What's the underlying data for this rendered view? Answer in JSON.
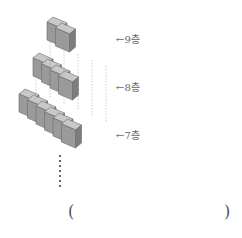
{
  "diagram": {
    "layers": [
      {
        "floor_label": "9층",
        "cube_count": 2
      },
      {
        "floor_label": "8층",
        "cube_count": 4
      },
      {
        "floor_label": "7층",
        "cube_count": 6
      }
    ],
    "arrow_glyph": "←",
    "continuation": "⋮",
    "answer": {
      "open": "(",
      "close": ")",
      "value": ""
    }
  },
  "colors": {
    "cube_front": "#9a9a9a",
    "cube_side": "#7d7d7d",
    "cube_top": "#c8c8c8",
    "edge": "#6a6a6a",
    "guide": "#999999"
  }
}
